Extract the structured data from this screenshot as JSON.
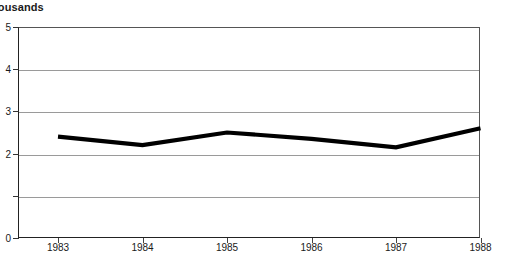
{
  "chart_data": {
    "type": "line",
    "title": "",
    "axis_caption": "housands",
    "axis_caption_full": "Thousands",
    "xlabel": "",
    "ylabel": "",
    "categories": [
      "1983",
      "1984",
      "1985",
      "1986",
      "1987",
      "1988"
    ],
    "series": [
      {
        "name": "",
        "values": [
          2.4,
          2.2,
          2.5,
          2.35,
          2.15,
          2.6
        ]
      }
    ],
    "ylim": [
      0,
      5
    ],
    "yticks": [
      0,
      1,
      2,
      3,
      4,
      5
    ],
    "ytick_labels": [
      "0",
      "",
      "2",
      "3",
      "4",
      "5"
    ],
    "grid": true,
    "legend": "none",
    "line_color": "#000000",
    "grid_color": "#9a9a9a",
    "frame_color": "#222222",
    "background_color": "#ffffff"
  },
  "ticks": {
    "y": [
      {
        "value": "5",
        "label": "5"
      },
      {
        "value": "4",
        "label": "4"
      },
      {
        "value": "3",
        "label": "3"
      },
      {
        "value": "2",
        "label": "2"
      },
      {
        "value": "1",
        "label": ""
      },
      {
        "value": "0",
        "label": "0"
      }
    ],
    "x": [
      {
        "label": "1983"
      },
      {
        "label": "1984"
      },
      {
        "label": "1985"
      },
      {
        "label": "1986"
      },
      {
        "label": "1987"
      },
      {
        "label": "1988"
      }
    ]
  }
}
